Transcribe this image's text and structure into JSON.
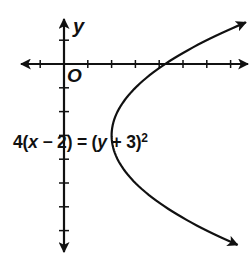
{
  "chart_data": {
    "type": "line",
    "title": "",
    "equation": {
      "text": "4(x − 2) = (y + 3)^2",
      "coef": "4",
      "x_var": "x",
      "minus": " − ",
      "h": "2",
      "equals": ") = (",
      "y_var": "y",
      "plus": " + ",
      "k": "3",
      "close": ")",
      "exponent": "2"
    },
    "curve": {
      "kind": "parabola",
      "opens": "right",
      "vertex": [
        2,
        -3
      ],
      "p4": 4,
      "y_range": [
        -7.6,
        1.75
      ],
      "arrows": "both",
      "sample_points": [
        {
          "x": 2,
          "y": -3
        },
        {
          "x": 3,
          "y": -1
        },
        {
          "x": 3,
          "y": -5
        },
        {
          "x": 4.25,
          "y": 0
        },
        {
          "x": 4.25,
          "y": -6
        },
        {
          "x": 6,
          "y": 1
        },
        {
          "x": 6,
          "y": -7
        }
      ]
    },
    "axes": {
      "xlabel": "x",
      "ylabel": "y",
      "origin_label": "O",
      "xlim": [
        -1.8,
        7.7
      ],
      "ylim": [
        -7.9,
        1.8
      ],
      "x_ticks": [
        -1,
        1,
        2,
        3,
        4,
        5,
        6,
        7
      ],
      "y_ticks": [
        1,
        -1,
        -2,
        -3,
        -4,
        -5,
        -6,
        -7
      ],
      "tick_labels_shown": false,
      "grid": false
    },
    "layout": {
      "origin_px": [
        64,
        64
      ],
      "unit_px": 23.8,
      "x_axis_px": [
        21,
        248
      ],
      "y_axis_px": [
        19,
        252
      ],
      "color": "#111111"
    }
  }
}
